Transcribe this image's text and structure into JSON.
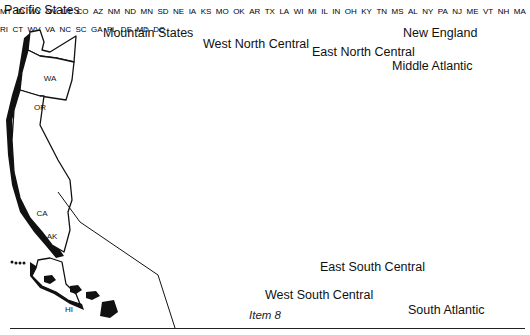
{
  "caption": "Item 8",
  "regions": {
    "pacific": {
      "name": "Pacific States",
      "states": [
        "WA",
        "OR",
        "CA",
        "AK",
        "HI"
      ]
    },
    "mountain": {
      "name": "Mountain States",
      "states": [
        "MT",
        "ID",
        "WY",
        "NV",
        "UT",
        "CO",
        "AZ",
        "NM"
      ]
    },
    "west_north_central": {
      "name": "West North Central",
      "states": [
        "ND",
        "MN",
        "SD",
        "NE",
        "IA",
        "KS",
        "MO"
      ]
    },
    "east_north_central": {
      "name": "East North Central",
      "states": [
        "WI",
        "MI",
        "IL",
        "IN",
        "OH"
      ]
    },
    "new_england": {
      "name": "New England",
      "states": [
        "VT",
        "ME",
        "NH",
        "MA",
        "RI",
        "CT"
      ]
    },
    "middle_atlantic": {
      "name": "Middle Atlantic",
      "states": [
        "NY",
        "PA",
        "NJ"
      ]
    },
    "west_south_central": {
      "name": "West South Central",
      "states": [
        "OK",
        "AR",
        "TX",
        "LA"
      ]
    },
    "east_south_central": {
      "name": "East South Central",
      "states": [
        "KY",
        "TN",
        "MS",
        "AL"
      ]
    },
    "south_atlantic": {
      "name": "South Atlantic",
      "states": [
        "DE",
        "MD",
        "DC",
        "WV",
        "VA",
        "NC",
        "SC",
        "GA",
        "FL"
      ]
    }
  },
  "state_labels": {
    "WA": "WA",
    "OR": "OR",
    "CA": "CA",
    "AK": "AK",
    "HI": "HI",
    "MT": "MT",
    "ID": "ID",
    "WY": "WY",
    "NV": "NV",
    "UT": "UT",
    "CO": "CO",
    "AZ": "AZ",
    "NM": "NM",
    "ND": "ND",
    "MN": "MN",
    "SD": "SD",
    "NE": "NE",
    "IA": "IA",
    "KS": "KS",
    "MO": "MO",
    "WI": "WI",
    "MI": "MI",
    "IL": "IL",
    "IN": "IN",
    "OH": "OH",
    "VT": "VT",
    "ME": "ME",
    "NH": "NH",
    "MA": "MA",
    "RI": "RI",
    "CT": "CT",
    "NY": "NY",
    "PA": "PA",
    "NJ": "NJ",
    "OK": "OK",
    "AR": "AR",
    "TX": "TX",
    "LA": "LA",
    "KY": "KY",
    "TN": "TN",
    "MS": "MS",
    "AL": "AL",
    "DE": "DE",
    "MD": "MD",
    "DC": "DC",
    "WV": "WV",
    "VA": "VA",
    "NC": "NC",
    "SC": "SC",
    "GA": "GA",
    "FL": "FL"
  },
  "colors": {
    "ink": "#111111",
    "background": "#ffffff"
  }
}
